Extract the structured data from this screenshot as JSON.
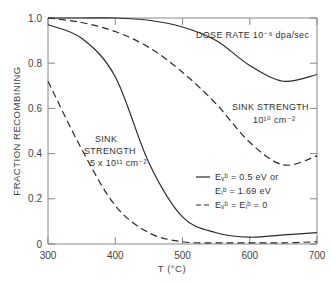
{
  "chart_data": {
    "type": "line",
    "title": "",
    "xlabel": "T (°C)",
    "ylabel": "FRACTION RECOMBINING",
    "xlim": [
      300,
      700
    ],
    "ylim": [
      0,
      1.0
    ],
    "xticks": [
      300,
      400,
      500,
      600,
      700
    ],
    "yticks": [
      0,
      0.2,
      0.4,
      0.6,
      0.8,
      1.0
    ],
    "ytick_labels": [
      "0",
      "0.2",
      "0.4",
      "0.6",
      "0.8",
      "1.0"
    ],
    "grid": false,
    "annotations": {
      "dose_rate": "DOSE RATE 10⁻⁶ dpa/sec",
      "sink_low_line1": "SINK STRENGTH",
      "sink_low_line2": "10¹⁰ cm⁻²",
      "sink_high_line1": "SINK",
      "sink_high_line2": "STRENGTH",
      "sink_high_line3": "5 x 10¹¹ cm⁻²"
    },
    "legend": [
      {
        "style": "solid",
        "label_line1": "Eᵥᵇ = 0.5 eV or",
        "label_line2": "Eᵢᵇ = 1.69 eV"
      },
      {
        "style": "dashed",
        "label_line1": "Eᵥᵇ = Eᵢᵇ = 0"
      }
    ],
    "x": [
      300,
      350,
      400,
      450,
      500,
      550,
      600,
      650,
      700
    ],
    "series": [
      {
        "name": "Sink 10^10 cm^-2, binding energy (solid)",
        "style": "solid",
        "values": [
          1.0,
          1.0,
          1.0,
          0.99,
          0.96,
          0.9,
          0.79,
          0.72,
          0.75
        ]
      },
      {
        "name": "Sink 10^10 cm^-2, no binding (dashed)",
        "style": "dashed",
        "values": [
          1.0,
          0.98,
          0.94,
          0.87,
          0.76,
          0.62,
          0.45,
          0.35,
          0.39
        ]
      },
      {
        "name": "Sink 5x10^11 cm^-2, binding energy (solid)",
        "style": "solid",
        "values": [
          0.97,
          0.91,
          0.74,
          0.36,
          0.12,
          0.05,
          0.03,
          0.04,
          0.05
        ]
      },
      {
        "name": "Sink 5x10^11 cm^-2, no binding (dashed)",
        "style": "dashed",
        "values": [
          0.72,
          0.42,
          0.17,
          0.05,
          0.01,
          0.005,
          0.005,
          0.005,
          0.01
        ]
      }
    ]
  },
  "colors": {
    "line": "#2a2a2a",
    "axis": "#888888",
    "text": "#444444"
  }
}
